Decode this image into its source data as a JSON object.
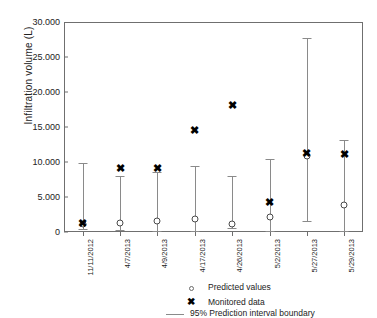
{
  "chart_data": {
    "type": "scatter",
    "title": "",
    "xlabel": "",
    "ylabel": "Infiltration volume (L)",
    "ylim": [
      0,
      30000
    ],
    "yticks": [
      0,
      5000,
      10000,
      15000,
      20000,
      25000,
      30000
    ],
    "ytick_labels": [
      "0",
      "5.000",
      "10.000",
      "15.000",
      "20.000",
      "25.000",
      "30.000"
    ],
    "grid": false,
    "legend_position": "bottom",
    "categories": [
      "11/11/2012",
      "4/7/2013",
      "4/9/2013",
      "4/17/2013",
      "4/26/2013",
      "5/2/2013",
      "5/27/2013",
      "5/29/2013"
    ],
    "series": [
      {
        "name": "Predicted values",
        "marker": "open-circle",
        "values": [
          1100,
          1250,
          1550,
          1850,
          1150,
          2200,
          10900,
          3850
        ]
      },
      {
        "name": "Monitored data",
        "marker": "bold-x",
        "values": [
          1300,
          9200,
          9100,
          14600,
          18200,
          4300,
          11300,
          11150
        ]
      },
      {
        "name": "95% Prediction interval boundary",
        "marker": "line",
        "lower": [
          400,
          350,
          200,
          150,
          550,
          100,
          1600,
          150
        ],
        "upper": [
          9800,
          7950,
          8550,
          9500,
          8000,
          10500,
          27700,
          13200
        ]
      }
    ]
  },
  "legend": {
    "items": [
      {
        "label": "Predicted values",
        "symbol": "open-circle"
      },
      {
        "label": "Monitored data",
        "symbol": "bold-x"
      },
      {
        "label": "95% Prediction interval boundary",
        "symbol": "line"
      }
    ]
  },
  "markers": {
    "x_glyph": "✖"
  }
}
